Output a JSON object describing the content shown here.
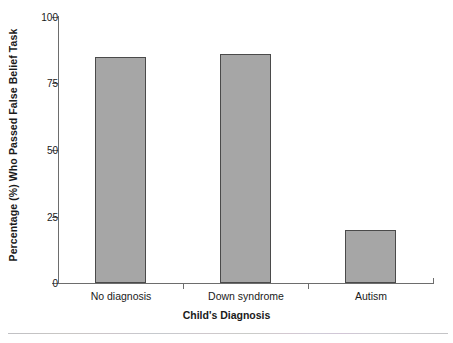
{
  "chart_data": {
    "type": "bar",
    "title": "",
    "xlabel": "Child's Diagnosis",
    "ylabel": "Percentage (%) Who Passed False Belief Task",
    "categories": [
      "No diagnosis",
      "Down syndrome",
      "Autism"
    ],
    "values": [
      85,
      86,
      20
    ],
    "ylim": [
      0,
      100
    ],
    "yticks": [
      0,
      25,
      50,
      75,
      100
    ],
    "ytick_labels": [
      "0",
      "25",
      "50",
      "75",
      "100"
    ],
    "grid": false,
    "legend": false,
    "bar_color": "#a6a6a6",
    "bar_edge_color": "#4a4a4a",
    "axis_color": "#6d6d6d",
    "text_color": "#1a1a1a",
    "background": "#ffffff"
  },
  "axes": {
    "y_title": "Percentage (%) Who Passed False Belief Task",
    "x_title": "Child's Diagnosis",
    "y_tick_labels": [
      "100",
      "75",
      "50",
      "25",
      "0"
    ],
    "x_tick_labels": [
      "No diagnosis",
      "Down syndrome",
      "Autism"
    ]
  }
}
